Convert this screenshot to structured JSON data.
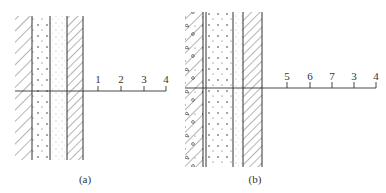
{
  "figure_a": {
    "caption": "(a)",
    "axis_labels": [
      "1",
      "2",
      "3",
      "4"
    ]
  },
  "figure_b": {
    "caption": "(b)",
    "axis_labels": [
      "5",
      "6",
      "7",
      "3",
      "4"
    ]
  },
  "colors": {
    "line": "#333333",
    "background": "#ffffff"
  }
}
